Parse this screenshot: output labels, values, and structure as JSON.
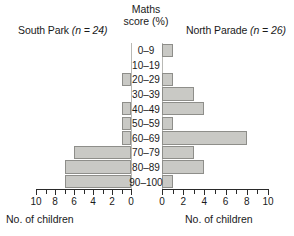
{
  "chart_data": {
    "type": "bar",
    "subtype": "back-to-back population pyramid",
    "title": "",
    "center_header": "Maths score (%)",
    "categories": [
      "0–9",
      "10–19",
      "20–29",
      "30–39",
      "40–49",
      "50–59",
      "60–69",
      "70–79",
      "80–89",
      "90–100"
    ],
    "category_axis_label": "Maths score (%)",
    "value_axis_label": "No. of children",
    "series": [
      {
        "name": "South Park",
        "n_label": "South Park (n = 24)",
        "school": "South Park",
        "n": 24,
        "side": "left",
        "direction": "reversed",
        "values": [
          0,
          0,
          1,
          0,
          1,
          1,
          1,
          6,
          7,
          7
        ],
        "axis_label": "No. of children",
        "ticks": [
          10,
          8,
          6,
          4,
          2,
          0
        ],
        "tick_step": 1,
        "xlim": [
          0,
          10
        ]
      },
      {
        "name": "North Parade",
        "n_label": "North Parade (n = 26)",
        "school": "North Parade",
        "n": 26,
        "side": "right",
        "direction": "normal",
        "values": [
          1,
          0,
          1,
          3,
          4,
          1,
          8,
          3,
          4,
          1
        ],
        "axis_label": "No. of children",
        "ticks": [
          0,
          2,
          4,
          6,
          8,
          10
        ],
        "tick_step": 1,
        "xlim": [
          0,
          10
        ]
      }
    ],
    "grid": false,
    "legend": "none",
    "bar_fill": "#c9c9c5",
    "bar_stroke": "#8e8e8a",
    "axis_color": "#2a2a2a",
    "background": "#ffffff"
  },
  "left_panel": {
    "title_school": "South Park",
    "title_n": "(n = 24)",
    "caption": "No. of children"
  },
  "right_panel": {
    "title_school": "North Parade",
    "title_n": "(n = 26)",
    "caption": "No. of children"
  },
  "center": {
    "header_line1": "Maths",
    "header_line2": "score (%)"
  }
}
